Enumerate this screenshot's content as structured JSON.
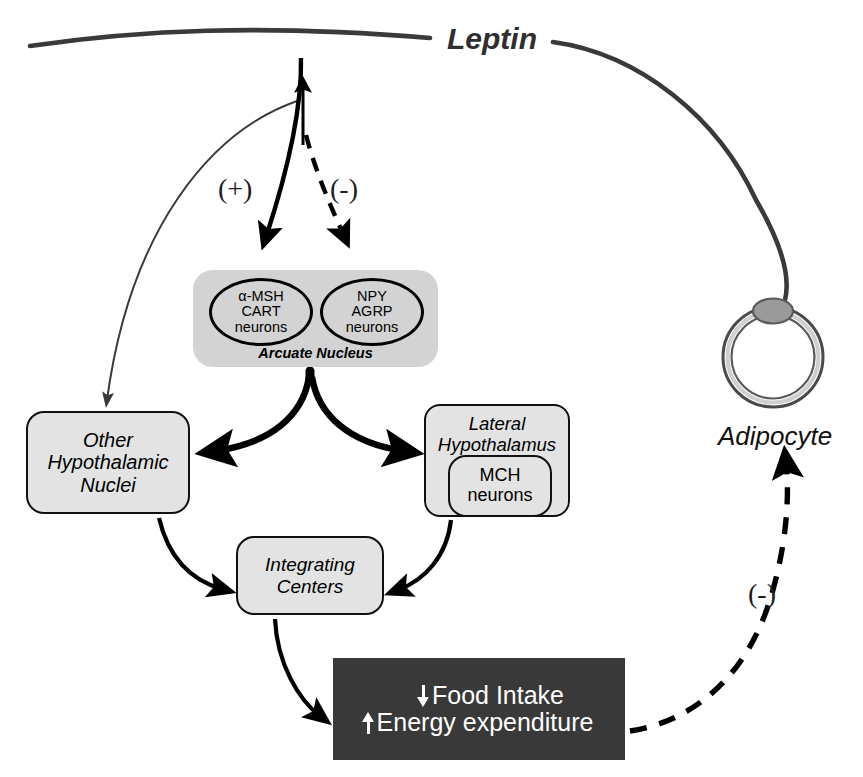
{
  "diagram": {
    "title_label": "Leptin",
    "adipocyte_label": "Adipocyte",
    "signs": {
      "plus_arcuate": "(+)",
      "minus_arcuate": "(-)",
      "minus_adipocyte": "(-)"
    },
    "arcuate": {
      "group_label": "Arcuate Nucleus",
      "neurons": [
        {
          "name": "alpha-msh-cart-neurons",
          "text": "α-MSH\nCART\nneurons"
        },
        {
          "name": "npy-agrp-neurons",
          "text": "NPY\nAGRP\nneurons"
        }
      ]
    },
    "nodes": {
      "other_hypothalamic_nuclei": "Other\nHypothalamic\nNuclei",
      "lateral_hypothalamus": "Lateral\nHypothalamus",
      "mch_neurons": "MCH\nneurons",
      "integrating_centers": "Integrating\nCenters"
    },
    "outcome": {
      "line1": "Food Intake",
      "line1_arrow": "down-arrow-icon",
      "line2": "Energy expenditure",
      "line2_arrow": "up-arrow-icon"
    },
    "colors": {
      "node_fill": "#e3e3e3",
      "arcuate_fill": "#d3d3d3",
      "outcome_fill": "#393939",
      "outcome_text": "#ffffff",
      "stroke": "#111111",
      "leptin_arc": "#3a3a3a",
      "nucleus_fill": "#9a9a9a"
    },
    "edges": [
      {
        "name": "leptin-to-adipocyte-arc",
        "style": "solid-thick",
        "from": "leptin",
        "to": "adipocyte"
      },
      {
        "name": "leptin-to-other-hypothalamic-nuclei",
        "style": "solid-thin",
        "from": "leptin",
        "to": "other_hypothalamic_nuclei",
        "sign": "(-)"
      },
      {
        "name": "leptin-to-alpha-msh-cart",
        "style": "solid",
        "from": "leptin",
        "to": "alpha-msh-cart-neurons",
        "sign": "(+)"
      },
      {
        "name": "leptin-to-npy-agrp",
        "style": "dashed",
        "from": "leptin",
        "to": "npy-agrp-neurons",
        "sign": "(-)"
      },
      {
        "name": "arcuate-to-other-hypothalamic-nuclei",
        "style": "solid-thick-fork",
        "from": "arcuate",
        "to": "other_hypothalamic_nuclei"
      },
      {
        "name": "arcuate-to-lateral-hypothalamus",
        "style": "solid-thick-fork",
        "from": "arcuate",
        "to": "lateral_hypothalamus"
      },
      {
        "name": "other-hypothalamic-nuclei-to-integrating-centers",
        "style": "solid",
        "from": "other_hypothalamic_nuclei",
        "to": "integrating_centers"
      },
      {
        "name": "lateral-hypothalamus-to-integrating-centers",
        "style": "solid",
        "from": "lateral_hypothalamus",
        "to": "integrating_centers"
      },
      {
        "name": "integrating-centers-to-outcome",
        "style": "solid",
        "from": "integrating_centers",
        "to": "outcome"
      },
      {
        "name": "outcome-to-adipocyte",
        "style": "dashed-thick",
        "from": "outcome",
        "to": "adipocyte",
        "sign": "(-)"
      }
    ]
  }
}
